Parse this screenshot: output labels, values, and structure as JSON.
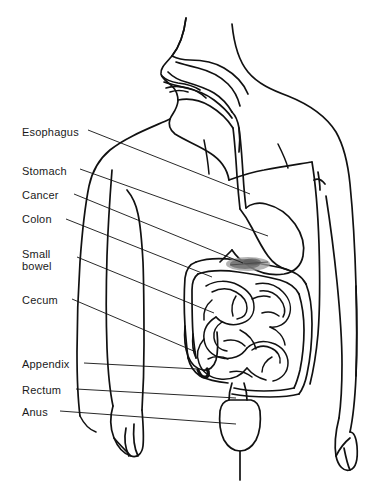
{
  "figure": {
    "type": "line-art-medical-illustration",
    "width": 382,
    "height": 500,
    "background_color": "#ffffff",
    "line_color": "#111111",
    "text_color": "#1a1a1a",
    "lesion_color": "#8a8a8a"
  },
  "labels": [
    {
      "id": "esophagus",
      "text": "Esophagus",
      "x": 22,
      "y": 126,
      "leader": {
        "x1": 88,
        "y1": 130,
        "x2": 250,
        "y2": 194
      }
    },
    {
      "id": "stomach",
      "text": "Stomach",
      "x": 22,
      "y": 165,
      "leader": {
        "x1": 80,
        "y1": 169,
        "x2": 268,
        "y2": 236
      }
    },
    {
      "id": "cancer",
      "text": "Cancer",
      "x": 22,
      "y": 189,
      "leader": {
        "x1": 74,
        "y1": 194,
        "x2": 243,
        "y2": 263
      }
    },
    {
      "id": "colon",
      "text": "Colon",
      "x": 22,
      "y": 213,
      "leader": {
        "x1": 66,
        "y1": 219,
        "x2": 212,
        "y2": 277
      }
    },
    {
      "id": "small-bowel",
      "text": "Small\nbowel",
      "x": 22,
      "y": 248,
      "leader": {
        "x1": 77,
        "y1": 257,
        "x2": 214,
        "y2": 313
      }
    },
    {
      "id": "cecum",
      "text": "Cecum",
      "x": 22,
      "y": 294,
      "leader": {
        "x1": 72,
        "y1": 299,
        "x2": 196,
        "y2": 352
      }
    },
    {
      "id": "appendix",
      "text": "Appendix",
      "x": 22,
      "y": 358,
      "leader": {
        "x1": 84,
        "y1": 363,
        "x2": 197,
        "y2": 369
      }
    },
    {
      "id": "rectum",
      "text": "Rectum",
      "x": 22,
      "y": 384,
      "leader": {
        "x1": 76,
        "y1": 389,
        "x2": 236,
        "y2": 398
      }
    },
    {
      "id": "anus",
      "text": "Anus",
      "x": 22,
      "y": 406,
      "leader": {
        "x1": 60,
        "y1": 411,
        "x2": 236,
        "y2": 424
      }
    }
  ],
  "organs": [
    {
      "id": "head-profile",
      "name": "Head and mouth profile"
    },
    {
      "id": "esophagus-tube",
      "name": "Esophagus"
    },
    {
      "id": "stomach-pouch",
      "name": "Stomach"
    },
    {
      "id": "cancer-lesion",
      "name": "Cancer lesion on transverse colon"
    },
    {
      "id": "colon-frame",
      "name": "Colon"
    },
    {
      "id": "small-bowel-coil",
      "name": "Small bowel"
    },
    {
      "id": "cecum-pouch",
      "name": "Cecum"
    },
    {
      "id": "appendix-tip",
      "name": "Appendix"
    },
    {
      "id": "rectum-bulb",
      "name": "Rectum"
    },
    {
      "id": "anal-canal",
      "name": "Anus"
    },
    {
      "id": "body-outline",
      "name": "Human torso outline"
    }
  ]
}
